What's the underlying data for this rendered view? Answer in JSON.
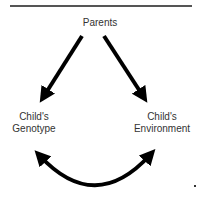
{
  "diagram": {
    "nodes": {
      "parents": "Parents",
      "genotype_line1": "Child's",
      "genotype_line2": "Genotype",
      "environment_line1": "Child's",
      "environment_line2": "Environment"
    },
    "edges": [
      {
        "from": "Parents",
        "to": "Child's Genotype",
        "type": "directed"
      },
      {
        "from": "Parents",
        "to": "Child's Environment",
        "type": "directed"
      },
      {
        "from": "Child's Genotype",
        "to": "Child's Environment",
        "type": "bidirectional-curved"
      }
    ],
    "colors": {
      "arrow": "#000000",
      "rule": "#555555",
      "text": "#333333"
    }
  }
}
